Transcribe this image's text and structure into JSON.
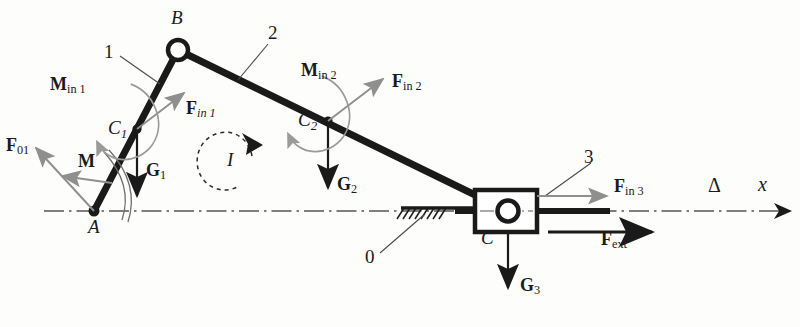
{
  "figure": {
    "type": "mechanism-free-body-diagram",
    "background_color": "#fdfdfc",
    "link_color": "#1a1a1a",
    "inertia_arrow_color": "#8c8c8c",
    "force_arrow_color": "#1a1a1a"
  },
  "joints": [
    {
      "id": "A",
      "label": "A",
      "x": 94,
      "y": 211,
      "kind": "fixed-pivot"
    },
    {
      "id": "B",
      "label": "B",
      "x": 178,
      "y": 50,
      "kind": "revolute-circle"
    },
    {
      "id": "C",
      "label": "C",
      "x": 508,
      "y": 211,
      "kind": "slider-pin"
    }
  ],
  "centers": [
    {
      "id": "C1",
      "base": "C",
      "sub": "1",
      "x": 137,
      "y": 129
    },
    {
      "id": "C2",
      "base": "C",
      "sub": "2",
      "x": 328,
      "y": 121
    }
  ],
  "link_labels": [
    {
      "id": "link1",
      "text": "1",
      "x": 108,
      "y": 53
    },
    {
      "id": "link2",
      "text": "2",
      "x": 272,
      "y": 33
    },
    {
      "id": "link3",
      "text": "3",
      "x": 588,
      "y": 158
    },
    {
      "id": "link0",
      "text": "0",
      "x": 369,
      "y": 258
    }
  ],
  "vectors": [
    {
      "id": "F01",
      "base": "F",
      "sub": "01",
      "label_x": 6,
      "label_y": 147,
      "style": "inertia"
    },
    {
      "id": "M",
      "base": "M",
      "sub": "",
      "label_x": 80,
      "label_y": 163,
      "style": "inertia"
    },
    {
      "id": "G1",
      "base": "G",
      "sub": "1",
      "label_x": 148,
      "label_y": 172,
      "style": "force"
    },
    {
      "id": "Min1",
      "base": "M",
      "sub": "in 1",
      "label_x": 54,
      "label_y": 86,
      "style": "inertia-moment"
    },
    {
      "id": "Fin1",
      "base": "F",
      "sub": "in 1",
      "label_x": 188,
      "label_y": 110,
      "style": "inertia"
    },
    {
      "id": "Min2",
      "base": "M",
      "sub": "in 2",
      "label_x": 305,
      "label_y": 72,
      "style": "inertia-moment"
    },
    {
      "id": "Fin2",
      "base": "F",
      "sub": "in 2",
      "label_x": 395,
      "label_y": 83,
      "style": "inertia"
    },
    {
      "id": "G2",
      "base": "G",
      "sub": "2",
      "label_x": 340,
      "label_y": 186,
      "style": "force"
    },
    {
      "id": "Fin3",
      "base": "F",
      "sub": "in 3",
      "label_x": 616,
      "label_y": 188,
      "style": "inertia"
    },
    {
      "id": "Fext",
      "base": "F",
      "sub": "ext",
      "label_x": 604,
      "label_y": 241,
      "style": "force"
    },
    {
      "id": "G3",
      "base": "G",
      "sub": "3",
      "label_x": 523,
      "label_y": 287,
      "style": "force"
    }
  ],
  "annotations": [
    {
      "id": "rotation-I",
      "text": "I",
      "x": 230,
      "y": 159,
      "kind": "dashed-ccw-arc"
    },
    {
      "id": "axis-delta",
      "text": "Δ",
      "x": 711,
      "y": 186,
      "kind": "axis-mark"
    },
    {
      "id": "axis-x",
      "text": "x",
      "x": 760,
      "y": 186,
      "kind": "axis-name"
    }
  ],
  "ground": {
    "hatch_x_start": 403,
    "hatch_x_end": 445,
    "hatch_y": 207
  }
}
